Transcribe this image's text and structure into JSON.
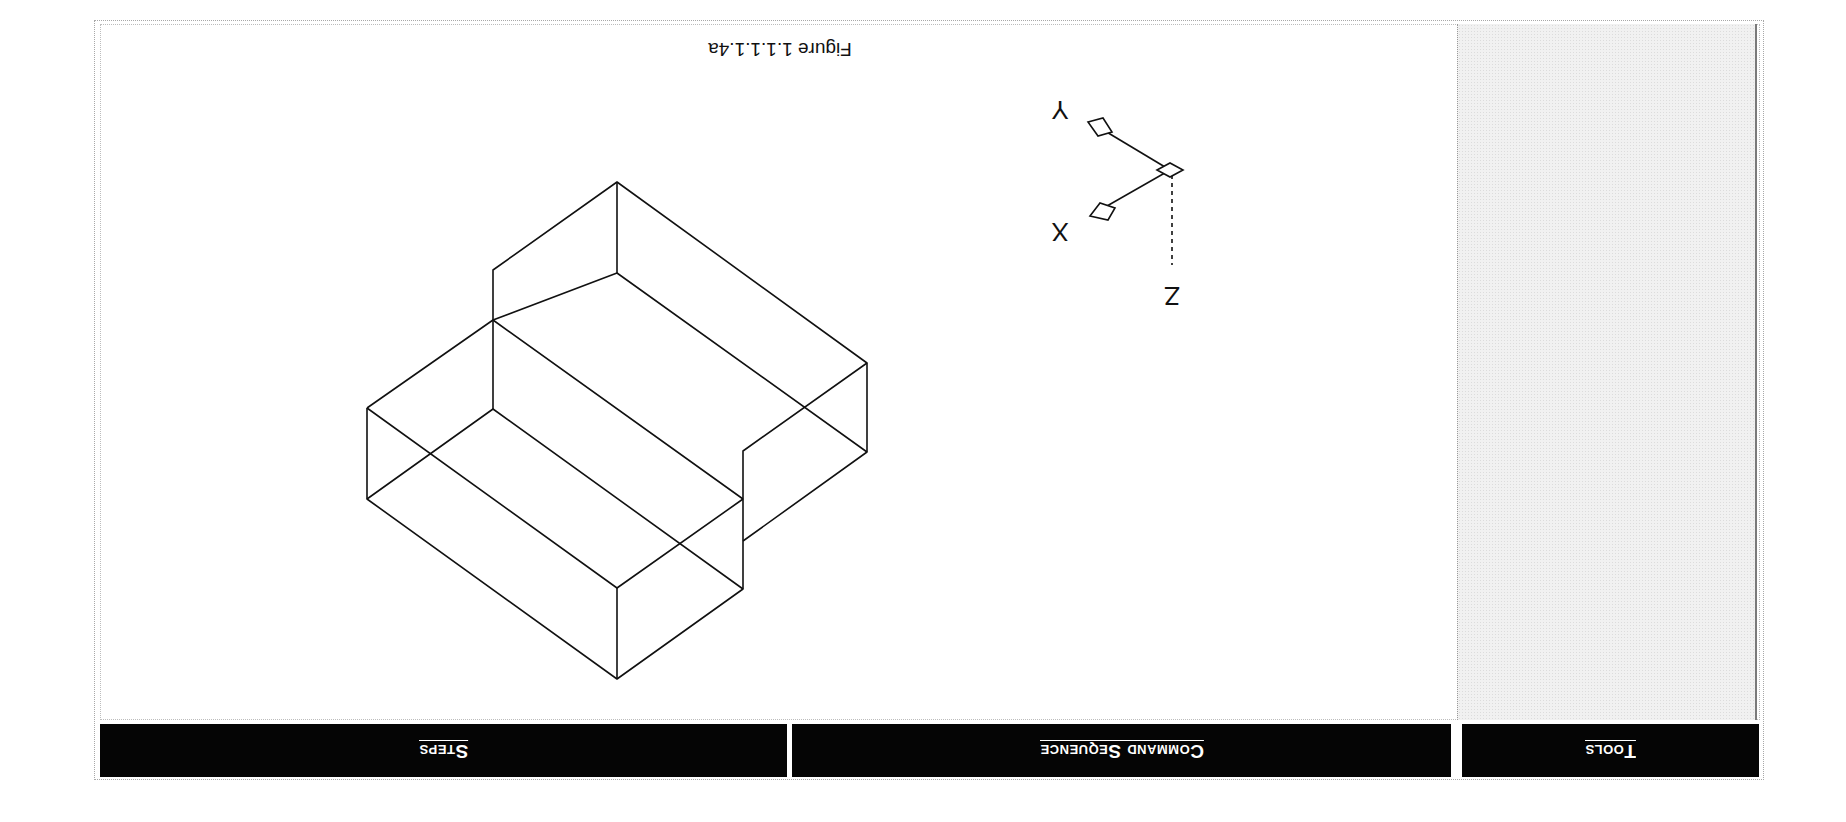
{
  "page": {
    "orientation": "rotated-180",
    "header": {
      "columns": [
        {
          "label": "Steps"
        },
        {
          "label": "Command Sequence"
        },
        {
          "label": "Tools"
        }
      ]
    },
    "figure": {
      "caption": "Figure 1.1.1.1.4a",
      "ucs_icon": {
        "icon": "ucs-axis-icon",
        "axes": [
          {
            "label": "X"
          },
          {
            "label": "Y"
          },
          {
            "label": "Z"
          }
        ]
      },
      "model": {
        "icon": "isometric-stepped-block-wireframe",
        "style": "wireframe",
        "line_color": "#111111"
      }
    },
    "colors": {
      "header_bg": "#050505",
      "header_text": "#ffffff",
      "tools_panel_bg": "#f1f1f1"
    }
  }
}
